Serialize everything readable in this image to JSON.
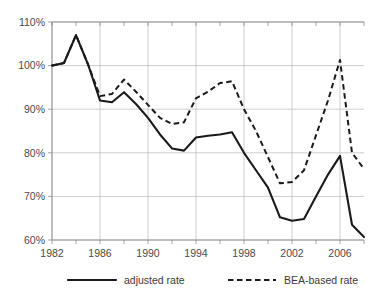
{
  "chart_data": {
    "type": "line",
    "title": "",
    "subtitle": "",
    "xlabel": "",
    "ylabel": "",
    "xlim": [
      1982,
      2008
    ],
    "ylim": [
      60,
      110
    ],
    "grid": true,
    "legend_position": "bottom",
    "y_tick_labels": [
      "110%",
      "100%",
      "90%",
      "80%",
      "70%",
      "60%"
    ],
    "y_tick_values": [
      110,
      100,
      90,
      80,
      70,
      60
    ],
    "x_tick_labels": [
      "1982",
      "1986",
      "1990",
      "1994",
      "1998",
      "2002",
      "2006"
    ],
    "x_tick_values": [
      1982,
      1986,
      1990,
      1994,
      1998,
      2002,
      2006
    ],
    "x_minor_tick_values": [
      1984,
      1988,
      1992,
      1996,
      2000,
      2004,
      2008
    ],
    "x": [
      1982,
      1983,
      1984,
      1985,
      1986,
      1987,
      1988,
      1989,
      1990,
      1991,
      1992,
      1993,
      1994,
      1995,
      1996,
      1997,
      1998,
      1999,
      2000,
      2001,
      2002,
      2003,
      2004,
      2005,
      2006,
      2007,
      2008
    ],
    "series": [
      {
        "name": "adjusted rate",
        "style": "solid",
        "color": "#1a1a1a",
        "values": [
          100.0,
          100.6,
          107.0,
          100.3,
          92.0,
          91.6,
          93.9,
          91.2,
          88.0,
          84.2,
          81.0,
          80.5,
          83.5,
          83.9,
          84.2,
          84.7,
          80.0,
          76.0,
          72.0,
          65.2,
          64.4,
          64.8,
          70.0,
          75.0,
          79.3,
          63.5,
          60.7
        ]
      },
      {
        "name": "BEA-based rate",
        "style": "dashed",
        "color": "#1a1a1a",
        "values": [
          100.0,
          100.6,
          107.0,
          100.3,
          93.0,
          93.5,
          96.8,
          94.0,
          91.0,
          88.0,
          86.6,
          87.0,
          92.5,
          94.0,
          96.0,
          96.4,
          90.0,
          85.0,
          79.0,
          73.0,
          73.3,
          76.0,
          84.0,
          92.0,
          101.3,
          80.0,
          76.3
        ]
      }
    ],
    "legend": [
      {
        "label": "adjusted rate",
        "style": "solid"
      },
      {
        "label": "BEA-based rate",
        "style": "dashed"
      }
    ]
  }
}
